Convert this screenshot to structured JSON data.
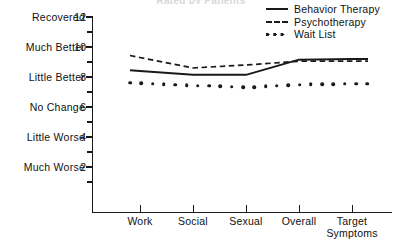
{
  "title": "Rated by Patients",
  "legend": {
    "position": "top-right",
    "entries": [
      {
        "label": "Behavior Therapy",
        "style": "solid",
        "key": "line-solid-icon"
      },
      {
        "label": "Psychotherapy",
        "style": "dashed",
        "key": "line-dashed-icon"
      },
      {
        "label": "Wait List",
        "style": "dotted",
        "key": "line-dotted-icon"
      }
    ]
  },
  "y_axis": {
    "ticks": [
      {
        "value": 12,
        "number": "12",
        "label": "Recovered"
      },
      {
        "value": 10,
        "number": "10",
        "label": "Much Better"
      },
      {
        "value": 8,
        "number": "8",
        "label": "Little Better"
      },
      {
        "value": 6,
        "number": "6",
        "label": "No Change"
      },
      {
        "value": 4,
        "number": "4",
        "label": "Little Worse"
      },
      {
        "value": 2,
        "number": "2",
        "label": "Much Worse"
      }
    ],
    "minor_ticks": [
      11,
      9,
      7,
      5,
      3,
      1
    ]
  },
  "chart_data": {
    "type": "line",
    "title": "Rated by Patients",
    "xlabel": "",
    "ylabel": "",
    "categories": [
      "Work",
      "Social",
      "Sexual",
      "Overall",
      "Target Symptoms"
    ],
    "ylim": [
      0,
      12
    ],
    "xlim": [
      0,
      6
    ],
    "grid": false,
    "legend_position": "top-right",
    "series": [
      {
        "name": "Behavior Therapy",
        "style": "solid",
        "values": [
          8.4,
          8.15,
          8.15,
          9.15,
          9.2
        ]
      },
      {
        "name": "Psychotherapy",
        "style": "dashed",
        "values": [
          9.3,
          8.6,
          8.8,
          9.05,
          9.05
        ]
      },
      {
        "name": "Wait List",
        "style": "dotted",
        "values": [
          7.6,
          7.45,
          7.3,
          7.5,
          7.55
        ]
      }
    ],
    "ytick_values": [
      12,
      10,
      8,
      6,
      4,
      2
    ],
    "ytick_labels": [
      "Recovered 12",
      "Much Better 10",
      "Little Better 8",
      "No Change 6",
      "Little Worse 4",
      "Much Worse 2"
    ]
  },
  "colors": {
    "ink": "#1a1a1a",
    "background": "#ffffff"
  }
}
